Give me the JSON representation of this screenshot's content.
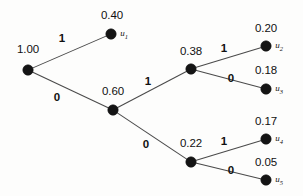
{
  "figure": {
    "type": "probability-tree-diagram",
    "colors": {
      "background": "#fdfdfc",
      "node_fill": "#141414",
      "edge_stroke": "#4a4a4a",
      "text": "#111111"
    }
  },
  "nodes": [
    {
      "id": "root",
      "prob": "1.00",
      "name": "",
      "sub": "",
      "x": 28,
      "y": 70,
      "r": 5.2,
      "prob_x": 28,
      "prob_y": 44
    },
    {
      "id": "n_u1",
      "prob": "0.40",
      "name": "u",
      "sub": "1",
      "x": 111,
      "y": 34,
      "r": 5.2,
      "prob_x": 112,
      "prob_y": 10
    },
    {
      "id": "n_060",
      "prob": "0.60",
      "name": "",
      "sub": "",
      "x": 113,
      "y": 110,
      "r": 5.2,
      "prob_x": 113,
      "prob_y": 86
    },
    {
      "id": "n_038",
      "prob": "0.38",
      "name": "",
      "sub": "",
      "x": 191,
      "y": 69,
      "r": 5.2,
      "prob_x": 191,
      "prob_y": 46
    },
    {
      "id": "n_u2",
      "prob": "0.20",
      "name": "u",
      "sub": "2",
      "x": 266,
      "y": 46,
      "r": 5.2,
      "prob_x": 266,
      "prob_y": 23
    },
    {
      "id": "n_u3",
      "prob": "0.18",
      "name": "u",
      "sub": "3",
      "x": 266,
      "y": 89,
      "r": 5.2,
      "prob_x": 266,
      "prob_y": 65
    },
    {
      "id": "n_022",
      "prob": "0.22",
      "name": "",
      "sub": "",
      "x": 191,
      "y": 162,
      "r": 5.2,
      "prob_x": 191,
      "prob_y": 138
    },
    {
      "id": "n_u4",
      "prob": "0.17",
      "name": "u",
      "sub": "4",
      "x": 266,
      "y": 139,
      "r": 5.2,
      "prob_x": 266,
      "prob_y": 116
    },
    {
      "id": "n_u5",
      "prob": "0.05",
      "name": "u",
      "sub": "5",
      "x": 266,
      "y": 180,
      "r": 5.2,
      "prob_x": 266,
      "prob_y": 157
    }
  ],
  "edges": [
    {
      "id": "e-root-u1",
      "from": "root",
      "to": "n_u1",
      "label": "1",
      "label_x": 62,
      "label_y": 33
    },
    {
      "id": "e-root-060",
      "from": "root",
      "to": "n_060",
      "label": "0",
      "label_x": 57,
      "label_y": 92
    },
    {
      "id": "e-060-038",
      "from": "n_060",
      "to": "n_038",
      "label": "1",
      "label_x": 148,
      "label_y": 76
    },
    {
      "id": "e-060-022",
      "from": "n_060",
      "to": "n_022",
      "label": "0",
      "label_x": 146,
      "label_y": 139
    },
    {
      "id": "e-038-u2",
      "from": "n_038",
      "to": "n_u2",
      "label": "1",
      "label_x": 224,
      "label_y": 43
    },
    {
      "id": "e-038-u3",
      "from": "n_038",
      "to": "n_u3",
      "label": "0",
      "label_x": 231,
      "label_y": 73
    },
    {
      "id": "e-022-u4",
      "from": "n_022",
      "to": "n_u4",
      "label": "1",
      "label_x": 224,
      "label_y": 136
    },
    {
      "id": "e-022-u5",
      "from": "n_022",
      "to": "n_u5",
      "label": "0",
      "label_x": 231,
      "label_y": 165
    }
  ],
  "chart_data": {
    "type": "tree",
    "title": "",
    "xlabel": "",
    "ylabel": "",
    "node_values": [
      1.0,
      0.4,
      0.6,
      0.38,
      0.2,
      0.18,
      0.22,
      0.17,
      0.05
    ],
    "node_labels": [
      "1.00",
      "0.40",
      "0.60",
      "0.38",
      "0.20",
      "0.18",
      "0.22",
      "0.17",
      "0.05"
    ],
    "leaf_names": [
      "u1",
      "u2",
      "u3",
      "u4",
      "u5"
    ],
    "leaf_values": [
      0.4,
      0.2,
      0.18,
      0.17,
      0.05
    ],
    "branch_labels": [
      "1",
      "0",
      "1",
      "0",
      "1",
      "0",
      "1",
      "0"
    ],
    "legend": []
  }
}
